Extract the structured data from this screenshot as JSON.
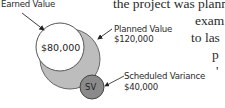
{
  "background_text": {
    "line1": "the project was planned",
    "line2": "exam",
    "line3": "to las",
    "line4": "p",
    "line5": "'"
  },
  "diagram": {
    "earned_value": {
      "label": "Earned Value",
      "value": "$80,000",
      "fill": "#ffffff"
    },
    "planned_value": {
      "label": "Planned Value",
      "value": "$120,000",
      "fill": "#bdbdbd"
    },
    "scheduled_variance": {
      "label": "Scheduled Variance",
      "value": "$40,000",
      "abbr": "SV",
      "fill": "#8a8a8a"
    }
  },
  "colors": {
    "stroke": "#555555",
    "arrow": "#222222",
    "text": "#2b2b2b"
  }
}
